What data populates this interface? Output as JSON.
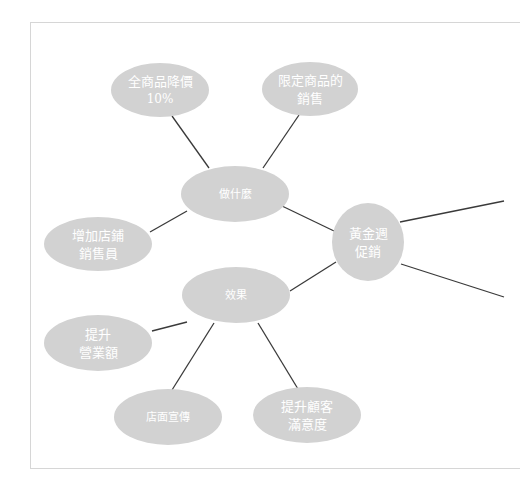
{
  "diagram": {
    "type": "mind-map",
    "central_node": {
      "id": "golden-week",
      "lines": [
        "黃金週",
        "促銷"
      ]
    },
    "nodes": [
      {
        "id": "what-to-do",
        "lines": [
          "做什麼"
        ],
        "parent": "golden-week"
      },
      {
        "id": "effects",
        "lines": [
          "效果"
        ],
        "parent": "golden-week"
      },
      {
        "id": "discount-all",
        "lines": [
          "全商品降價",
          "10%"
        ],
        "parent": "what-to-do"
      },
      {
        "id": "limited-items",
        "lines": [
          "限定商品的",
          "銷售"
        ],
        "parent": "what-to-do"
      },
      {
        "id": "add-staff",
        "lines": [
          "增加店鋪",
          "銷售員"
        ],
        "parent": "what-to-do"
      },
      {
        "id": "raise-revenue",
        "lines": [
          "提升",
          "營業額"
        ],
        "parent": "effects"
      },
      {
        "id": "store-promo",
        "lines": [
          "店面宣傳"
        ],
        "parent": "effects"
      },
      {
        "id": "customer-satisfaction",
        "lines": [
          "提升顧客",
          "滿意度"
        ],
        "parent": "effects"
      }
    ],
    "offscreen_branches": 2,
    "colors": {
      "node_fill": "#d2d2d2",
      "node_text": "#ffffff",
      "edge": "#3a3a3a",
      "frame": "#d6d6d6"
    }
  }
}
